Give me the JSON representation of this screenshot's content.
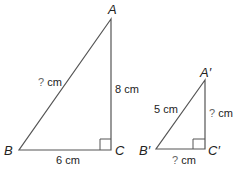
{
  "figure": {
    "large_triangle": {
      "vertices": {
        "A": "A",
        "B": "B",
        "C": "C"
      },
      "hypotenuse": {
        "q": "?",
        "unit": " cm"
      },
      "vertical_leg": "8 cm",
      "horizontal_leg": "6 cm"
    },
    "small_triangle": {
      "vertices": {
        "A": "A′",
        "B": "B′",
        "C": "C′"
      },
      "hypotenuse": "5 cm",
      "vertical_leg": {
        "q": "?",
        "unit": " cm"
      },
      "horizontal_leg": {
        "q": "?",
        "unit": " cm"
      }
    },
    "colors": {
      "line": "#555555",
      "text": "#222222",
      "question": "#666666"
    }
  }
}
